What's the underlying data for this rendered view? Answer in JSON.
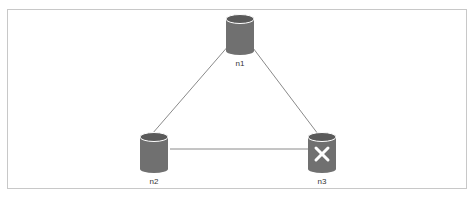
{
  "diagram": {
    "type": "cluster-topology",
    "nodes": [
      {
        "id": "n1",
        "label": "n1",
        "status": "up",
        "x": 240,
        "y": 34
      },
      {
        "id": "n2",
        "label": "n2",
        "status": "up",
        "x": 154,
        "y": 152
      },
      {
        "id": "n3",
        "label": "n3",
        "status": "down",
        "x": 322,
        "y": 152
      }
    ],
    "edges": [
      {
        "from": "n1",
        "to": "n2"
      },
      {
        "from": "n1",
        "to": "n3"
      },
      {
        "from": "n2",
        "to": "n3"
      }
    ],
    "colors": {
      "node_fill": "#707070",
      "node_top": "#5a5a5a",
      "edge": "#8a8a8a",
      "frame_border": "#c8c8c8",
      "down_marker": "#ffffff"
    }
  }
}
